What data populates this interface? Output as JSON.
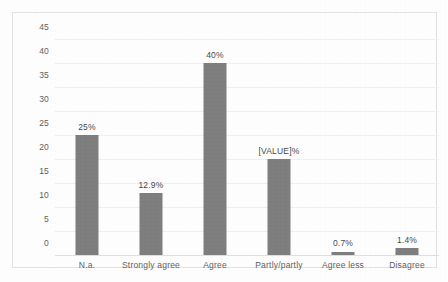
{
  "chart_data": {
    "type": "bar",
    "title": "",
    "subtitle": "",
    "xlabel": "",
    "ylabel": "",
    "categories": [
      "N.a.",
      "Strongly agree",
      "Agree",
      "Partly/partly",
      "Agree less",
      "Disagree"
    ],
    "values": [
      25,
      12.9,
      40,
      20,
      0.7,
      1.4
    ],
    "data_labels": [
      "25%",
      "12.9%",
      "40%",
      "[VALUE]%",
      "0.7%",
      "1.4%"
    ],
    "ylim": [
      0,
      45
    ],
    "ytick_step": 5,
    "yticks": [
      "45",
      "40",
      "35",
      "30",
      "25",
      "20",
      "15",
      "10",
      "5",
      "0"
    ],
    "grid": true,
    "grid_axis": "y",
    "legend": false,
    "legend_position": "none",
    "series": [
      {
        "name": "",
        "values": [
          25,
          12.9,
          40,
          20,
          0.7,
          1.4
        ]
      }
    ],
    "colors": {
      "bar": "#7f7f7f",
      "gridline": "#f1f1f1",
      "baseline": "#e0e0e0",
      "tick_text": "#5f5f5f",
      "label_text": "#4a4a4a",
      "frame_border": "#e3e3e3",
      "background": "#ffffff"
    }
  }
}
